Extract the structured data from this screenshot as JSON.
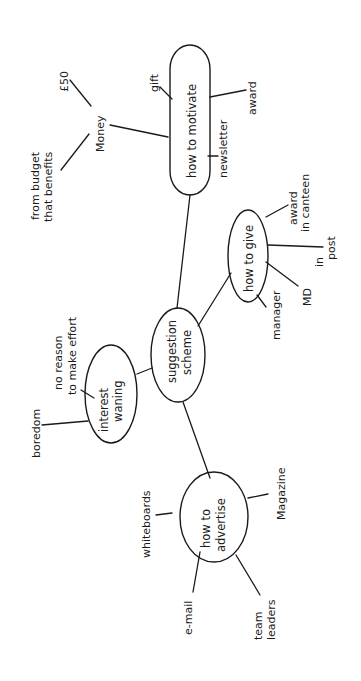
{
  "diagram": {
    "type": "mind-map",
    "orientation": "rotated-90-ccw",
    "center": {
      "label_line1": "suggestion",
      "label_line2": "scheme"
    },
    "branches": {
      "motivate": {
        "label": "how to motivate",
        "children": {
          "money": "Money",
          "gift": "gift",
          "award": "award",
          "newsletter": "newsletter"
        },
        "money_children": {
          "fifty": "£50",
          "budget_line1": "from budget",
          "budget_line2": "that benefits"
        }
      },
      "give": {
        "label": "how to give",
        "children": {
          "canteen_line1": "award",
          "canteen_line2": "in canteen",
          "post_line1": "in",
          "post_line2": "post",
          "md": "MD",
          "manager": "manager"
        }
      },
      "interest": {
        "label_line1": "interest",
        "label_line2": "waning",
        "children": {
          "reason_line1": "no reason",
          "reason_line2": "to make effort",
          "boredom": "boredom"
        }
      },
      "advertise": {
        "label_line1": "how to",
        "label_line2": "advertise",
        "children": {
          "whiteboards": "whiteboards",
          "magazine": "Magazine",
          "email": "e-mail",
          "team_line1": "team",
          "team_line2": "leaders"
        }
      }
    }
  }
}
